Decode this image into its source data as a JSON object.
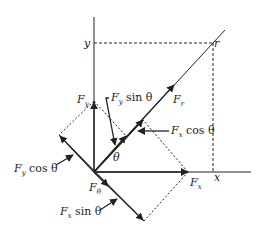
{
  "diagram": {
    "axes": {
      "x_label": "x",
      "y_label": "y"
    },
    "point_label": "r",
    "angle_label": "θ",
    "vectors": {
      "F_r": {
        "symbol": "F",
        "sub": "r"
      },
      "F_theta": {
        "symbol": "F",
        "sub": "θ"
      },
      "F_x": {
        "symbol": "F",
        "sub": "x"
      },
      "F_y": {
        "symbol": "F",
        "sub": "y"
      }
    },
    "annotations": {
      "fy_sin": {
        "symbol": "F",
        "sub": "y",
        "rest": " sin θ"
      },
      "fx_cos": {
        "symbol": "F",
        "sub": "x",
        "rest": " cos θ"
      },
      "fy_cos": {
        "symbol": "F",
        "sub": "y",
        "rest": " cos θ"
      },
      "fx_sin": {
        "symbol": "F",
        "sub": "x",
        "rest": " sin θ"
      }
    },
    "colors": {
      "line": "#222222",
      "background": "#ffffff"
    }
  }
}
